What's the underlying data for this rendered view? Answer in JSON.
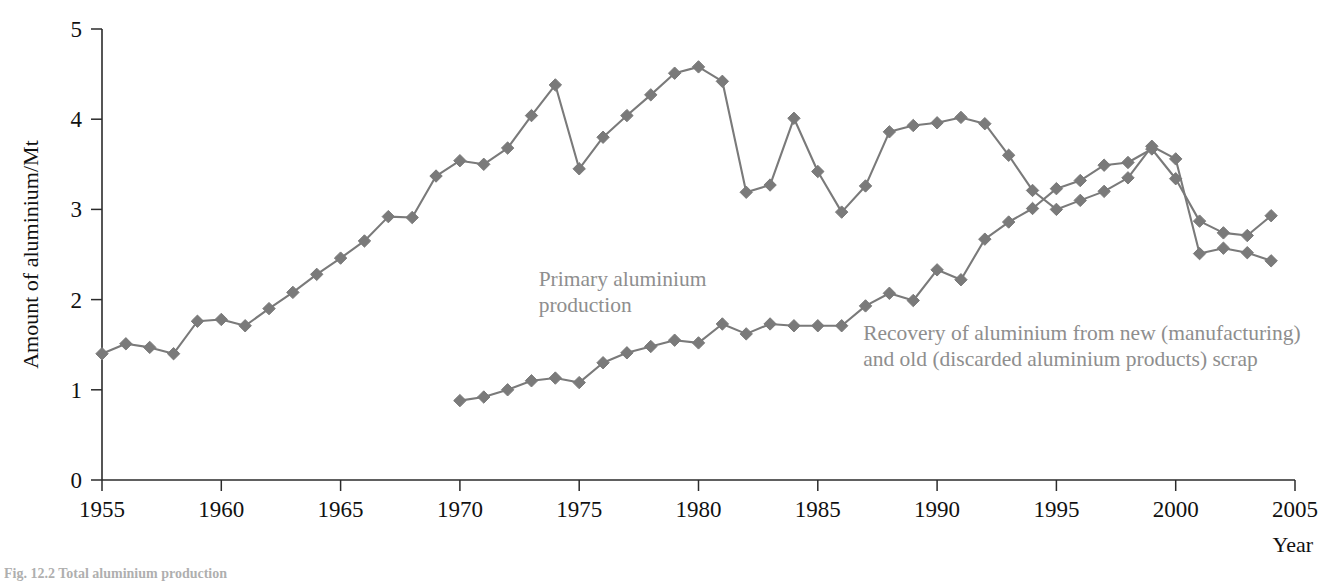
{
  "chart_data": {
    "type": "line",
    "title": "",
    "xlabel": "Year",
    "ylabel": "Amount of aluminium/Mt",
    "xlim": [
      1955,
      2005
    ],
    "ylim": [
      0,
      5
    ],
    "xticks": [
      1955,
      1960,
      1965,
      1970,
      1975,
      1980,
      1985,
      1990,
      1995,
      2000,
      2005
    ],
    "yticks": [
      0,
      1,
      2,
      3,
      4,
      5
    ],
    "grid": false,
    "legend_position": "inline-annotations",
    "series": [
      {
        "name": "Primary aluminium production",
        "color": "#7a7a7a",
        "marker": "diamond",
        "x": [
          1955,
          1956,
          1957,
          1958,
          1959,
          1960,
          1961,
          1962,
          1963,
          1964,
          1965,
          1966,
          1967,
          1968,
          1969,
          1970,
          1971,
          1972,
          1973,
          1974,
          1975,
          1976,
          1977,
          1978,
          1979,
          1980,
          1981,
          1982,
          1983,
          1984,
          1985,
          1986,
          1987,
          1988,
          1989,
          1990,
          1991,
          1992,
          1993,
          1994,
          1995,
          1996,
          1997,
          1998,
          1999,
          2000,
          2001,
          2002,
          2003,
          2004
        ],
        "values": [
          1.4,
          1.51,
          1.47,
          1.4,
          1.76,
          1.78,
          1.71,
          1.9,
          2.08,
          2.28,
          2.46,
          2.65,
          2.92,
          2.91,
          3.37,
          3.54,
          3.5,
          3.68,
          4.04,
          4.38,
          3.45,
          3.8,
          4.04,
          4.27,
          4.51,
          4.58,
          4.42,
          3.19,
          3.27,
          4.01,
          3.42,
          2.97,
          3.26,
          3.86,
          3.93,
          3.96,
          4.02,
          3.95,
          3.6,
          3.21,
          3.0,
          3.1,
          3.2,
          3.35,
          3.7,
          3.56,
          2.51,
          2.57,
          2.52,
          2.43
        ]
      },
      {
        "name": "Recovery of aluminium from new (manufacturing) and old (discarded aluminium products) scrap",
        "color": "#7a7a7a",
        "marker": "diamond",
        "x": [
          1970,
          1971,
          1972,
          1973,
          1974,
          1975,
          1976,
          1977,
          1978,
          1979,
          1980,
          1981,
          1982,
          1983,
          1984,
          1985,
          1986,
          1987,
          1988,
          1989,
          1990,
          1991,
          1992,
          1993,
          1994,
          1995,
          1996,
          1997,
          1998,
          1999,
          2000,
          2001,
          2002,
          2003,
          2004
        ],
        "values": [
          0.88,
          0.92,
          1.0,
          1.1,
          1.13,
          1.08,
          1.3,
          1.41,
          1.48,
          1.55,
          1.52,
          1.73,
          1.62,
          1.73,
          1.71,
          1.71,
          1.71,
          1.93,
          2.07,
          1.99,
          2.33,
          2.22,
          2.67,
          2.86,
          3.01,
          3.23,
          3.32,
          3.49,
          3.52,
          3.67,
          3.34,
          2.87,
          2.74,
          2.71,
          2.93
        ]
      }
    ],
    "annotations": [
      {
        "id": "primary-label",
        "lines": [
          "Primary aluminium",
          "production"
        ],
        "x": 1973.3,
        "y": 2.15
      },
      {
        "id": "recovery-label",
        "lines": [
          "Recovery of aluminium from new (manufacturing)",
          "and old (discarded aluminium products) scrap"
        ],
        "x": 1986.9,
        "y": 1.55
      }
    ]
  },
  "caption": {
    "text": "Fig. 12.2 Total aluminium production"
  }
}
